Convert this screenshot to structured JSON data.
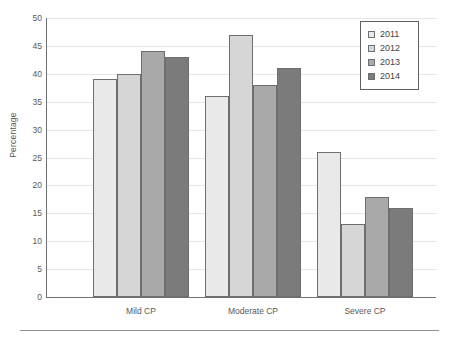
{
  "chart_data": {
    "type": "bar",
    "title": "",
    "xlabel": "",
    "ylabel": "Percentage",
    "categories": [
      "Mild CP",
      "Moderate CP",
      "Severe CP"
    ],
    "series": [
      {
        "name": "2011",
        "color": "#e9e9e9",
        "values": [
          39,
          36,
          26
        ]
      },
      {
        "name": "2012",
        "color": "#d6d6d6",
        "values": [
          40,
          47,
          13
        ]
      },
      {
        "name": "2013",
        "color": "#a9a9a9",
        "values": [
          44,
          38,
          18
        ]
      },
      {
        "name": "2014",
        "color": "#7b7b7b",
        "values": [
          43,
          41,
          16
        ]
      }
    ],
    "ylim": [
      0,
      50
    ],
    "y_ticks": [
      0,
      5,
      10,
      15,
      20,
      25,
      30,
      35,
      40,
      45,
      50
    ],
    "grid": true,
    "legend_position": "top-right"
  },
  "legend": {
    "items": [
      {
        "label": "2011"
      },
      {
        "label": "2012"
      },
      {
        "label": "2013"
      },
      {
        "label": "2014"
      }
    ]
  }
}
